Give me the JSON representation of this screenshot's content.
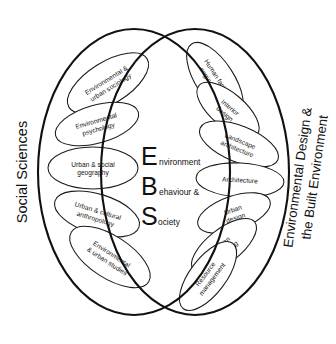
{
  "diagram": {
    "background_color": "#ffffff",
    "stroke_color": "#111111",
    "left_side_label": "Social Sciences",
    "right_side_label_line1": "Environmental Design &",
    "right_side_label_line2": "the Built Environment",
    "core": {
      "lines": [
        {
          "cap": "E",
          "rest": "nvironment"
        },
        {
          "cap": "B",
          "rest": "ehaviour &"
        },
        {
          "cap": "S",
          "rest": "ociety"
        }
      ]
    },
    "left_petals": [
      {
        "label_line1": "Environmental &",
        "label_line2": "urban sociology",
        "cx": 108,
        "cy": 83,
        "rx": 46,
        "ry": 21,
        "angle": -32
      },
      {
        "label_line1": "Environmental",
        "label_line2": "psychology",
        "cx": 97,
        "cy": 124,
        "rx": 43,
        "ry": 19,
        "angle": -16
      },
      {
        "label_line1": "Urban & social",
        "label_line2": "geography",
        "cx": 93,
        "cy": 168,
        "rx": 45,
        "ry": 21,
        "angle": 0
      },
      {
        "label_line1": "Urban & cultural",
        "label_line2": "anthropology",
        "cx": 97,
        "cy": 214,
        "rx": 44,
        "ry": 20,
        "angle": 17
      },
      {
        "label_line1": "Environmental",
        "label_line2": "& urban studies",
        "cx": 110,
        "cy": 257,
        "rx": 46,
        "ry": 21,
        "angle": 33
      }
    ],
    "right_petals": [
      {
        "label_line1": "Human factors",
        "label_line2": "engineering",
        "cx": 215,
        "cy": 80,
        "rx": 43,
        "ry": 19,
        "angle": 57
      },
      {
        "label_line1": "Interior",
        "label_line2": "design",
        "cx": 228,
        "cy": 110,
        "rx": 38,
        "ry": 17,
        "angle": 40
      },
      {
        "label_line1": "Landscape",
        "label_line2": "architecture",
        "cx": 239,
        "cy": 144,
        "rx": 42,
        "ry": 18,
        "angle": 22
      },
      {
        "label_line1": "Architecture",
        "label_line2": "",
        "cx": 240,
        "cy": 180,
        "rx": 44,
        "ry": 17,
        "angle": 3
      },
      {
        "label_line1": "Urban",
        "label_line2": "design",
        "cx": 234,
        "cy": 213,
        "rx": 38,
        "ry": 17,
        "angle": -19
      },
      {
        "label_line1": "Urban",
        "label_line2": "planning",
        "cx": 224,
        "cy": 246,
        "rx": 39,
        "ry": 17,
        "angle": -38
      },
      {
        "label_line1": "Resource",
        "label_line2": "management",
        "cx": 208,
        "cy": 276,
        "rx": 41,
        "ry": 18,
        "angle": -53
      }
    ],
    "lobes": [
      {
        "name": "left-lobe",
        "cx": 134,
        "cy": 172,
        "rx": 96,
        "ry": 143
      },
      {
        "name": "right-lobe",
        "cx": 195,
        "cy": 172,
        "rx": 94,
        "ry": 143
      }
    ]
  }
}
